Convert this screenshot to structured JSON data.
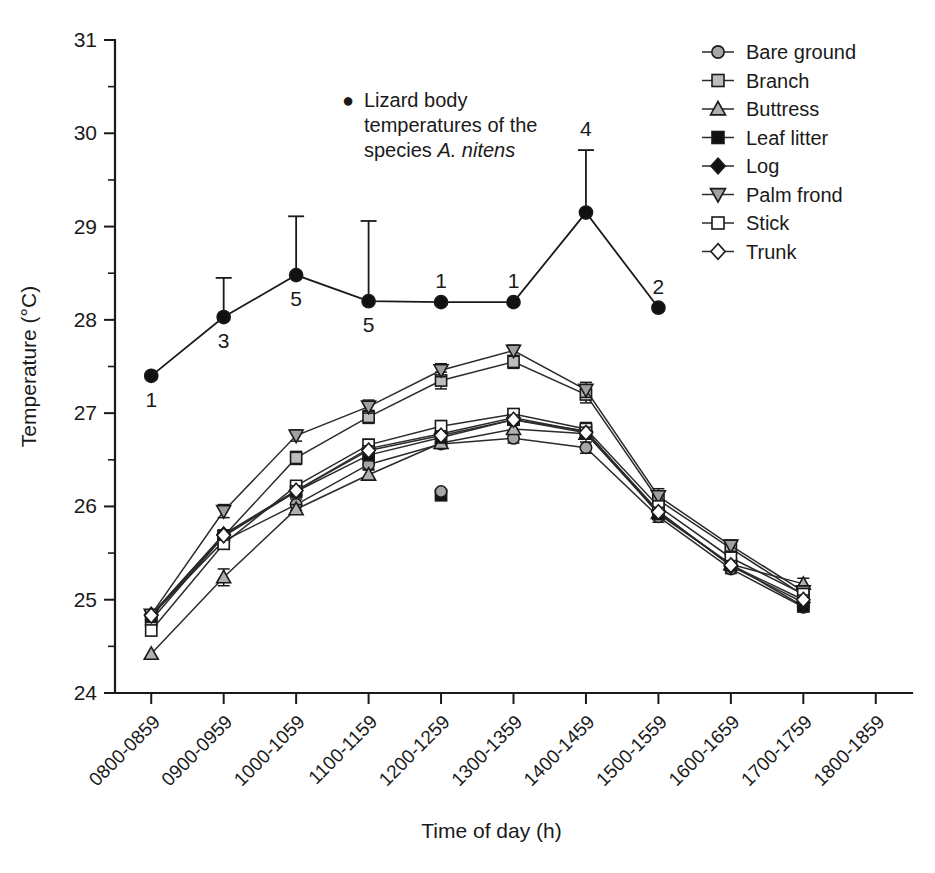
{
  "chart_data": {
    "type": "line",
    "title": "",
    "xlabel": "Time of day (h)",
    "ylabel": "Temperature (°C)",
    "ylim": [
      24,
      31
    ],
    "y_major_ticks": [
      24,
      25,
      26,
      27,
      28,
      29,
      30,
      31
    ],
    "y_minor_step": 0.5,
    "grid": false,
    "legend_position": "top-right",
    "categories": [
      "0800-0859",
      "0900-0959",
      "1000-1059",
      "1100-1159",
      "1200-1259",
      "1300-1359",
      "1400-1459",
      "1500-1559",
      "1600-1659",
      "1700-1759",
      "1800-1859"
    ],
    "series": [
      {
        "name": "Bare ground",
        "marker": "circle",
        "fill": "#a6a6a6",
        "values": [
          24.83,
          25.63,
          26.02,
          26.45,
          26.67,
          26.73,
          26.63,
          25.89,
          25.33,
          24.92,
          null
        ],
        "errors": [
          0,
          0.06,
          0.06,
          0.05,
          0.05,
          0.05,
          0.06,
          0.06,
          0.05,
          0.05,
          null
        ]
      },
      {
        "name": "Branch",
        "marker": "square",
        "fill": "#bdbdbd",
        "values": [
          24.78,
          25.68,
          26.52,
          26.96,
          27.35,
          27.55,
          27.2,
          26.07,
          25.55,
          25.05,
          null
        ],
        "errors": [
          0,
          0.06,
          0.07,
          0.07,
          0.09,
          0.07,
          0.09,
          0.09,
          0.07,
          0.06,
          null
        ]
      },
      {
        "name": "Buttress",
        "marker": "triangle-up",
        "fill": "#b0b0b0",
        "values": [
          24.42,
          25.24,
          25.97,
          26.34,
          26.68,
          26.83,
          26.78,
          25.93,
          25.38,
          25.17,
          null
        ],
        "errors": [
          0,
          0.09,
          0.05,
          0.05,
          0.05,
          0.05,
          0.05,
          0.06,
          0.05,
          0.06,
          null
        ]
      },
      {
        "name": "Leaf litter",
        "marker": "square",
        "fill": "#111111",
        "values": [
          24.82,
          25.68,
          26.16,
          26.55,
          26.74,
          26.93,
          26.81,
          25.92,
          25.38,
          24.93,
          null
        ],
        "errors": [
          0,
          0.05,
          0.05,
          0.05,
          0.05,
          0.05,
          0.06,
          0.05,
          0.04,
          0.04,
          null
        ]
      },
      {
        "name": "Log",
        "marker": "diamond",
        "fill": "#111111",
        "values": [
          24.84,
          25.7,
          26.17,
          26.62,
          26.78,
          26.95,
          26.8,
          25.95,
          25.36,
          24.97,
          null
        ],
        "errors": [
          0,
          0.05,
          0.05,
          0.05,
          0.05,
          0.05,
          0.06,
          0.06,
          0.05,
          0.05,
          null
        ]
      },
      {
        "name": "Palm frond",
        "marker": "triangle-down",
        "fill": "#a0a0a0",
        "values": [
          24.84,
          25.95,
          26.76,
          27.07,
          27.46,
          27.67,
          27.25,
          26.11,
          25.58,
          25.09,
          null
        ],
        "errors": [
          0,
          0.07,
          0.06,
          0.07,
          0.07,
          0.06,
          0.08,
          0.08,
          0.06,
          0.06,
          null
        ]
      },
      {
        "name": "Stick",
        "marker": "square",
        "fill": "#ffffff",
        "values": [
          24.67,
          25.6,
          26.22,
          26.66,
          26.86,
          26.99,
          26.83,
          26.0,
          25.45,
          25.06,
          null
        ],
        "errors": [
          0,
          0.05,
          0.05,
          0.06,
          0.06,
          0.05,
          0.07,
          0.06,
          0.05,
          0.05,
          null
        ]
      },
      {
        "name": "Trunk",
        "marker": "diamond",
        "fill": "#ffffff",
        "values": [
          24.83,
          25.69,
          26.17,
          26.6,
          26.76,
          26.93,
          26.79,
          25.94,
          25.37,
          25.0,
          null
        ],
        "errors": [
          0,
          0.05,
          0.05,
          0.05,
          0.05,
          0.05,
          0.06,
          0.05,
          0.05,
          0.05,
          null
        ]
      }
    ],
    "lizard_series": {
      "name": "Lizard body temperatures of the species A. nitens",
      "marker": "circle",
      "fill": "#111111",
      "values": [
        27.4,
        28.03,
        28.48,
        28.2,
        28.19,
        28.19,
        29.15,
        28.13,
        null,
        null,
        null
      ],
      "errors": [
        0,
        0.42,
        0.63,
        0.86,
        0,
        0,
        0.67,
        0,
        null,
        null,
        null
      ],
      "n_labels": [
        "1",
        "3",
        "5",
        "5",
        "1",
        "1",
        "4",
        "2",
        "",
        "",
        ""
      ],
      "n_label_pos": [
        "below",
        "below",
        "below",
        "below",
        "above",
        "above",
        "above",
        "above",
        "",
        "",
        ""
      ]
    },
    "extra_markers": [
      {
        "label": "bare-ground-outlier",
        "category": "1200-1259",
        "value": 26.12,
        "marker": "square",
        "fill": "#111111"
      },
      {
        "label": "bare-ground-outlier-circle",
        "category": "1200-1259",
        "value": 26.16,
        "marker": "circle",
        "fill": "#a6a6a6"
      }
    ]
  },
  "annotation": {
    "bullet": "●",
    "line1": "Lizard body",
    "line2": "temperatures of the",
    "line3_plain": "species ",
    "line3_italic": "A. nitens"
  },
  "legend": {
    "items": [
      {
        "label": "Bare ground",
        "marker": "circle",
        "fill": "#a6a6a6"
      },
      {
        "label": "Branch",
        "marker": "square",
        "fill": "#bdbdbd"
      },
      {
        "label": "Buttress",
        "marker": "triangle-up",
        "fill": "#b0b0b0"
      },
      {
        "label": "Leaf litter",
        "marker": "square",
        "fill": "#111111"
      },
      {
        "label": "Log",
        "marker": "diamond",
        "fill": "#111111"
      },
      {
        "label": "Palm frond",
        "marker": "triangle-down",
        "fill": "#a0a0a0"
      },
      {
        "label": "Stick",
        "marker": "square",
        "fill": "#ffffff"
      },
      {
        "label": "Trunk",
        "marker": "diamond",
        "fill": "#ffffff"
      }
    ]
  },
  "axes": {
    "y_title": "Temperature (°C)",
    "x_title": "Time of day (h)",
    "y_tick_labels": [
      "24",
      "25",
      "26",
      "27",
      "28",
      "29",
      "30",
      "31"
    ],
    "x_tick_labels": [
      "0800-0859",
      "0900-0959",
      "1000-1059",
      "1100-1159",
      "1200-1259",
      "1300-1359",
      "1400-1459",
      "1500-1559",
      "1600-1659",
      "1700-1759",
      "1800-1859"
    ]
  },
  "colors": {
    "axis": "#1a1a1a",
    "line": "#2b2b2b",
    "background": "#ffffff"
  }
}
